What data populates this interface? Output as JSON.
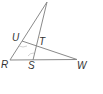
{
  "diagram": {
    "type": "geometry-triangle",
    "points": {
      "apex": {
        "x": 47,
        "y": 2
      },
      "R": {
        "x": 10,
        "y": 60
      },
      "S": {
        "x": 33,
        "y": 60
      },
      "W": {
        "x": 77,
        "y": 59.5
      },
      "U": {
        "x": 22,
        "y": 41
      },
      "T": {
        "x": 37,
        "y": 45
      }
    },
    "labels": {
      "R": "R",
      "S": "S",
      "W": "W",
      "U": "U",
      "T": "T"
    },
    "segments": [
      [
        "apex",
        "R"
      ],
      [
        "apex",
        "S"
      ],
      [
        "U",
        "W"
      ],
      [
        "R",
        "W"
      ]
    ],
    "colors": {
      "line": "#8a8a8a",
      "label": "#333333",
      "arc": "#c8c8c8"
    }
  }
}
